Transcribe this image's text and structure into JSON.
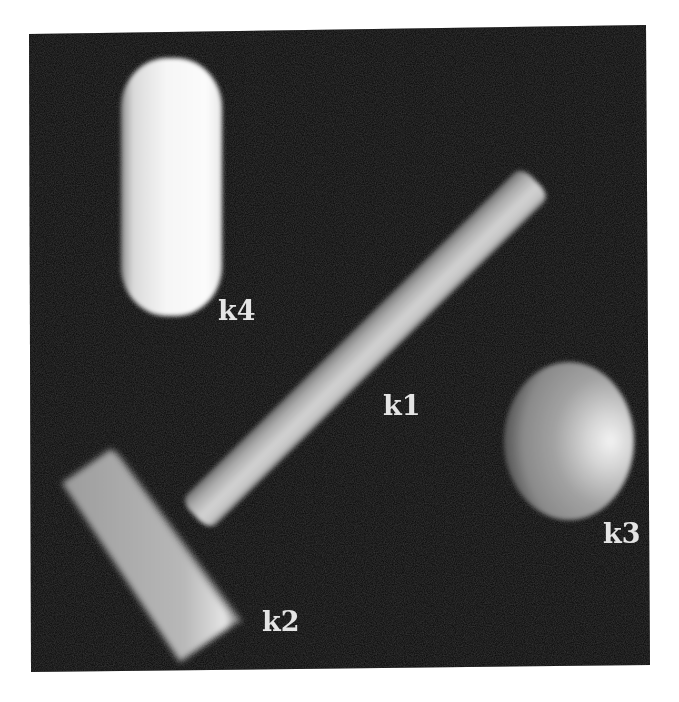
{
  "figure": {
    "background_color": "#070707",
    "page_color": "#ffffff",
    "objects": [
      {
        "id": "k1",
        "label": "k1",
        "shape": "cylinder-rod",
        "orientation": "diagonal, lower-left to upper-right",
        "color": "#bdbdbd"
      },
      {
        "id": "k2",
        "label": "k2",
        "shape": "rectangular-block",
        "orientation": "tilted, upper-left to lower-right",
        "color": "#b4b4b4"
      },
      {
        "id": "k3",
        "label": "k3",
        "shape": "ellipsoid",
        "orientation": "upright",
        "color": "#9a9a9a"
      },
      {
        "id": "k4",
        "label": "k4",
        "shape": "capsule",
        "orientation": "vertical",
        "color": "#f4f4f4"
      }
    ]
  }
}
